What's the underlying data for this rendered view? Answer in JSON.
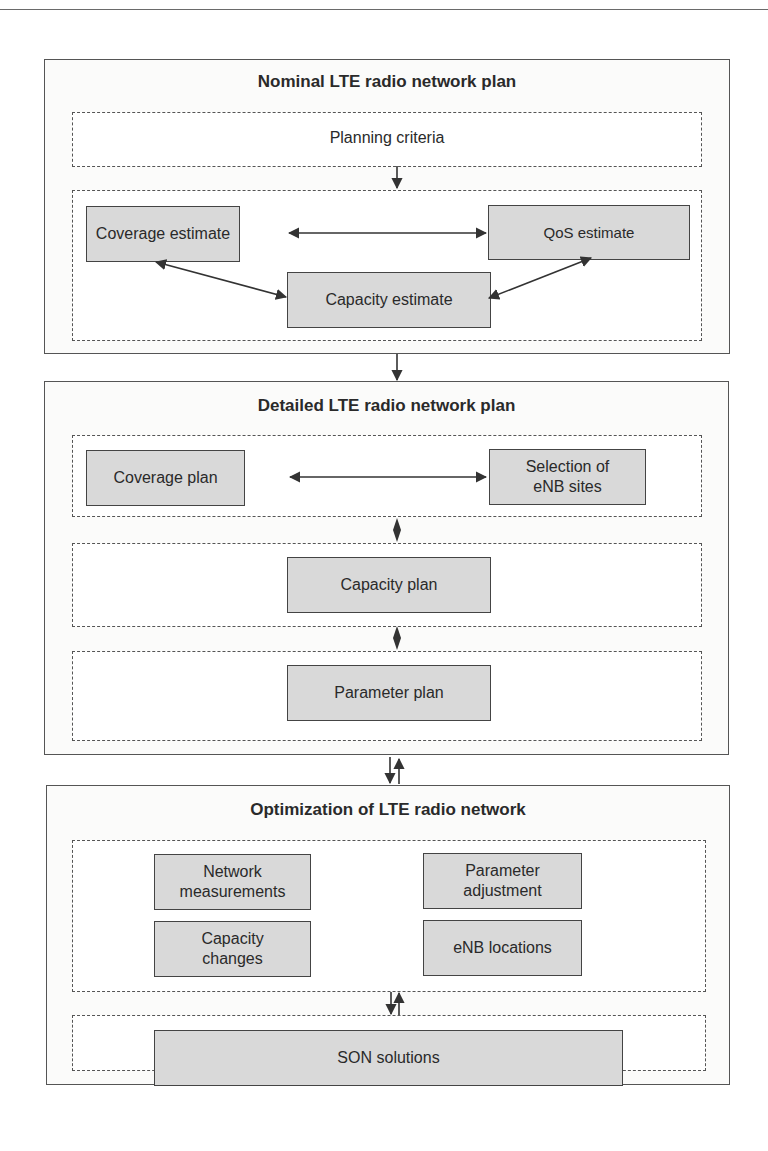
{
  "diagram": {
    "stage1": {
      "title": "Nominal LTE radio network plan",
      "criteria_label": "Planning criteria",
      "nodes": {
        "coverage": "Coverage estimate",
        "qos": "QoS estimate",
        "capacity": "Capacity estimate"
      }
    },
    "stage2": {
      "title": "Detailed LTE radio network plan",
      "nodes": {
        "coverage_plan": "Coverage plan",
        "site_selection": "Selection of eNB sites",
        "capacity_plan": "Capacity plan",
        "parameter_plan": "Parameter plan"
      }
    },
    "stage3": {
      "title": "Optimization of LTE radio network",
      "nodes": {
        "network_measurements": "Network measurements",
        "parameter_adjustment": "Parameter adjustment",
        "capacity_changes": "Capacity changes",
        "enb_locations": "eNB locations",
        "son": "SON solutions"
      }
    },
    "edges": [
      {
        "from": "Planning criteria",
        "to": "estimates group",
        "type": "arrow"
      },
      {
        "from": "Coverage estimate",
        "to": "QoS estimate",
        "type": "bidirectional"
      },
      {
        "from": "Coverage estimate",
        "to": "Capacity estimate",
        "type": "bidirectional"
      },
      {
        "from": "QoS estimate",
        "to": "Capacity estimate",
        "type": "bidirectional"
      },
      {
        "from": "Nominal LTE radio network plan",
        "to": "Detailed LTE radio network plan",
        "type": "arrow"
      },
      {
        "from": "Coverage plan",
        "to": "Selection of eNB sites",
        "type": "bidirectional"
      },
      {
        "from": "Coverage/site group",
        "to": "Capacity plan group",
        "type": "bidirectional"
      },
      {
        "from": "Capacity plan group",
        "to": "Parameter plan group",
        "type": "bidirectional"
      },
      {
        "from": "Detailed LTE radio network plan",
        "to": "Optimization of LTE radio network",
        "type": "two-way"
      },
      {
        "from": "Optimization group",
        "to": "SON solutions",
        "type": "two-way"
      }
    ],
    "colors": {
      "node_fill": "#d9d9d9",
      "stroke": "#444444",
      "panel_fill": "#fbfbfa"
    }
  }
}
